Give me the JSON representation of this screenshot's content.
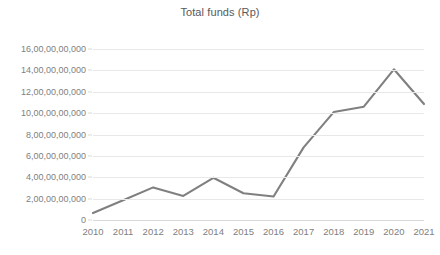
{
  "chart_data": {
    "type": "line",
    "title": "Total funds (Rp)",
    "xlabel": "",
    "ylabel": "",
    "grid": true,
    "legend": false,
    "legend_position": "none",
    "line_color": "#808080",
    "categories": [
      "2010",
      "2011",
      "2012",
      "2013",
      "2014",
      "2015",
      "2016",
      "2017",
      "2018",
      "2019",
      "2020",
      "2021"
    ],
    "x": [
      2010,
      2011,
      2012,
      2013,
      2014,
      2015,
      2016,
      2017,
      2018,
      2019,
      2020,
      2021
    ],
    "values": [
      650000000,
      1850000000,
      3050000000,
      2250000000,
      3950000000,
      2500000000,
      2200000000,
      6800000000,
      10100000000,
      10600000000,
      14100000000,
      10850000000
    ],
    "ylim": [
      0,
      16000000000
    ],
    "ytick_values": [
      0,
      2000000000,
      4000000000,
      6000000000,
      8000000000,
      10000000000,
      12000000000,
      14000000000,
      16000000000
    ],
    "ytick_labels": [
      "0",
      "2,00,00,00,000",
      "4,00,00,00,000",
      "6,00,00,00,000",
      "8,00,00,00,000",
      "10,00,00,00,000",
      "12,00,00,00,000",
      "14,00,00,00,000",
      "16,00,00,00,000"
    ]
  }
}
